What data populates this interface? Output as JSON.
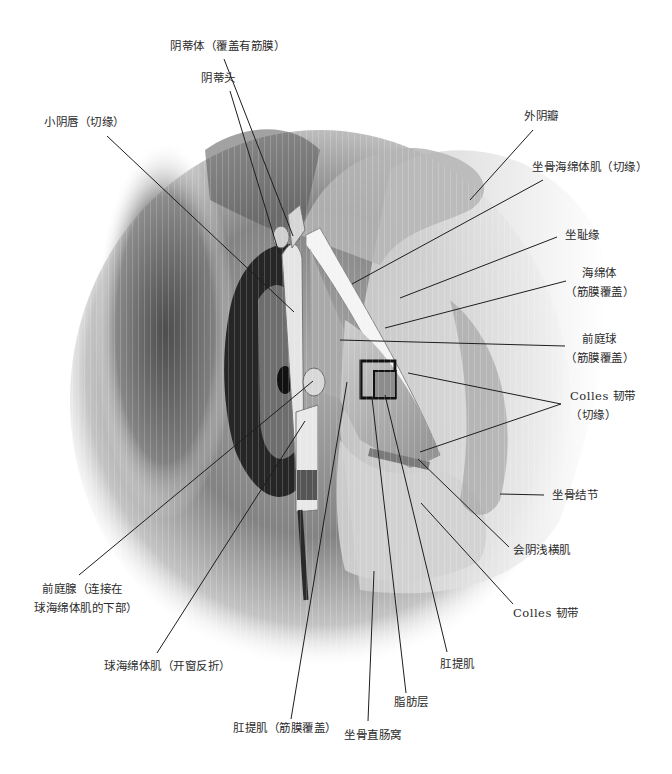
{
  "figure": {
    "colors": {
      "background": "#ffffff",
      "label_text": "#2a2a2a",
      "leader_line": "#1e1e1e",
      "dark_tone": "#2b2b2b",
      "mid_tone": "#8a8a8a",
      "light_tone": "#d9d9d9"
    }
  },
  "labels": {
    "clitoris_body": "阴蒂体（覆盖有筋膜）",
    "clitoris_glans": "阴蒂头",
    "labia_minora": "小阴唇（切缘）",
    "labia_majora": "外阴瓣",
    "ischiocavernosus": "坐骨海绵体肌（切缘）",
    "ischiopubic_ramus": "坐耻缘",
    "corpus_cavernosum_line1": "海绵体",
    "corpus_cavernosum_line2": "（筋膜覆盖）",
    "vestibular_bulb_line1": "前庭球",
    "vestibular_bulb_line2": "（筋膜覆盖）",
    "colles_cut_line1": "Colles 韧带",
    "colles_cut_line2": "（切缘）",
    "ischial_tuberosity": "坐骨结节",
    "superficial_transverse_perineal": "会阴浅横肌",
    "colles_fascia": "Colles 韧带",
    "levator_ani": "肛提肌",
    "fat_layer": "脂肪层",
    "ischiorectal_fossa": "坐骨直肠窝",
    "levator_ani_covered": "肛提肌（筋膜覆盖）",
    "bulbospongiosus": "球海绵体肌（开窗反折）",
    "greater_vestibular_gland_line1": "前庭腺（连接在",
    "greater_vestibular_gland_line2": "球海绵体肌的下部）"
  }
}
